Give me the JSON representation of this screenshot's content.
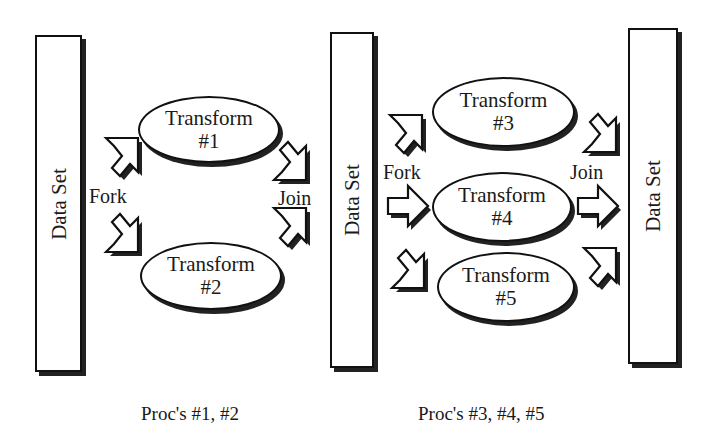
{
  "diagram": {
    "type": "fork-join dataflow",
    "left_group": {
      "input_box": {
        "label": "Data Set"
      },
      "fork_label": "Fork",
      "join_label": "Join",
      "transforms": [
        {
          "line1": "Transform",
          "line2": "#1"
        },
        {
          "line1": "Transform",
          "line2": "#2"
        }
      ],
      "caption": "Proc's #1, #2"
    },
    "right_group": {
      "input_box": {
        "label": "Data Set"
      },
      "output_box": {
        "label": "Data Set"
      },
      "fork_label": "Fork",
      "join_label": "Join",
      "transforms": [
        {
          "line1": "Transform",
          "line2": "#3"
        },
        {
          "line1": "Transform",
          "line2": "#4"
        },
        {
          "line1": "Transform",
          "line2": "#5"
        }
      ],
      "caption": "Proc's #3, #4, #5"
    },
    "colors": {
      "stroke": "#111111",
      "shadow": "#222222",
      "fill": "#ffffff"
    }
  }
}
